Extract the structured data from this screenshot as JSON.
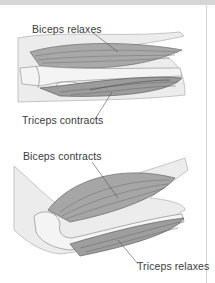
{
  "diagram": {
    "panels": [
      {
        "name": "extended-arm",
        "labels": {
          "top": "Biceps relaxes",
          "bottom": "Triceps contracts"
        }
      },
      {
        "name": "flexed-arm",
        "labels": {
          "top": "Biceps contracts",
          "bottom": "Triceps relaxes"
        }
      }
    ],
    "colors": {
      "muscle": "#8c8c8c",
      "muscle_dark": "#555555",
      "skin": "#e6e6e6",
      "bone": "#f2f2f2",
      "text": "#3a3a3a",
      "frame": "#d4d4d4"
    }
  }
}
